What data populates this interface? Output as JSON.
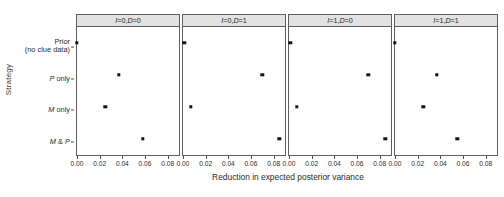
{
  "chart_data": {
    "type": "scatter",
    "title": "",
    "xlabel": "Reduction in expected posterior variance",
    "ylabel": "Strategy",
    "xlim": [
      0.0,
      0.09
    ],
    "xticks": [
      0.0,
      0.02,
      0.04,
      0.06,
      0.08
    ],
    "xticklabels": [
      "0.00",
      "0.02",
      "0.04",
      "0.06",
      "0.08"
    ],
    "categories": [
      "Prior (no clue data)",
      "P only",
      "M only",
      "M & P"
    ],
    "grid": false,
    "legend": null,
    "facets": [
      {
        "label": "I=0, D=0",
        "I": 0,
        "D": 0,
        "values": [
          0.0,
          0.037,
          0.025,
          0.058
        ]
      },
      {
        "label": "I=0, D=1",
        "I": 0,
        "D": 1,
        "values": [
          0.001,
          0.07,
          0.007,
          0.085
        ]
      },
      {
        "label": "I=1, D=0",
        "I": 1,
        "D": 0,
        "values": [
          0.001,
          0.07,
          0.007,
          0.085
        ]
      },
      {
        "label": "I=1, D=1",
        "I": 1,
        "D": 1,
        "values": [
          0.0,
          0.037,
          0.025,
          0.055
        ]
      }
    ]
  },
  "axes": {
    "y_title": "Strategy",
    "x_title": "Reduction in expected posterior variance",
    "y_labels": [
      {
        "line1": "Prior",
        "line2": "(no clue data)"
      },
      {
        "line1": "P only",
        "line2": ""
      },
      {
        "line1": "M only",
        "line2": ""
      },
      {
        "line1": "M & P",
        "line2": ""
      }
    ]
  },
  "strips": [
    {
      "left": "I=0",
      "right": "D=0",
      "text": "I=0, D=0"
    },
    {
      "left": "I=0",
      "right": "D=1",
      "text": "I=0, D=1"
    },
    {
      "left": "I=1",
      "right": "D=0",
      "text": "I=1, D=0"
    },
    {
      "left": "I=1",
      "right": "D=1",
      "text": "I=1, D=1"
    }
  ],
  "style": {
    "point_color": "#111111",
    "strip_fill": "#e2e2e2",
    "panel_border": "#5f5f5f",
    "background": "#ffffff"
  }
}
